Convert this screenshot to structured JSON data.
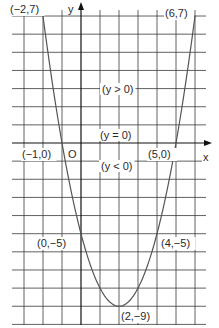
{
  "chart_data": {
    "type": "line",
    "title": "",
    "function": "y = x^2 - 4x - 5",
    "xlabel": "x",
    "ylabel": "y",
    "origin_label": "O",
    "xlim": [
      -3,
      7
    ],
    "ylim": [
      -10,
      7
    ],
    "grid": true,
    "points": [
      {
        "x": -2,
        "y": 7,
        "label": "(−2,7)"
      },
      {
        "x": 6,
        "y": 7,
        "label": "(6,7)"
      },
      {
        "x": -1,
        "y": 0,
        "label": "(−1,0)"
      },
      {
        "x": 5,
        "y": 0,
        "label": "(5,0)"
      },
      {
        "x": 0,
        "y": -5,
        "label": "(0,−5)"
      },
      {
        "x": 4,
        "y": -5,
        "label": "(4,−5)"
      },
      {
        "x": 2,
        "y": -9,
        "label": "(2,−9)"
      }
    ],
    "annotations": [
      {
        "text": "(y > 0)",
        "region": "above x-axis"
      },
      {
        "text": "(y = 0)",
        "region": "on x-axis"
      },
      {
        "text": "(y < 0)",
        "region": "below x-axis"
      }
    ]
  },
  "colors": {
    "grid": "#3a3a3a",
    "curve": "#555555",
    "text": "#2a2a2a"
  }
}
